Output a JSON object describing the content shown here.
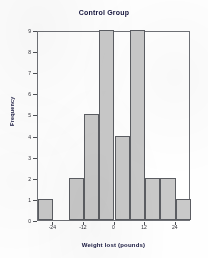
{
  "chart_data": {
    "type": "bar",
    "title": "Control Group",
    "xlabel": "Weight lost (pounds)",
    "ylabel": "Frequency",
    "grid": false,
    "legend": "none",
    "bin_width": 6,
    "bin_starts": [
      -30,
      -24,
      -18,
      -12,
      -6,
      0,
      6,
      12,
      18,
      24
    ],
    "categories": [
      "-30 to -24",
      "-24 to -18",
      "-18 to -12",
      "-12 to -6",
      "-6 to 0",
      "0 to 6",
      "6 to 12",
      "12 to 18",
      "18 to 24",
      "24 to 30"
    ],
    "values": [
      1,
      0,
      2,
      5,
      9,
      4,
      9,
      2,
      2,
      1
    ],
    "xlim": [
      -30,
      30
    ],
    "ylim": [
      0,
      9
    ],
    "xticks": [
      -24,
      -12,
      0,
      12,
      24
    ],
    "xtick_labels": [
      "-24",
      "-12",
      "0",
      "12",
      "24"
    ],
    "yticks": [
      0,
      1,
      2,
      3,
      4,
      5,
      6,
      7,
      8,
      9
    ],
    "ytick_labels": [
      "0",
      "1",
      "2",
      "3",
      "4",
      "5",
      "6",
      "7",
      "8",
      "9"
    ],
    "bar_color": "#c9c9c9",
    "bar_edge_color": "#5b5d62",
    "frame_color": "#6f7176",
    "text_color": "#14143c"
  }
}
